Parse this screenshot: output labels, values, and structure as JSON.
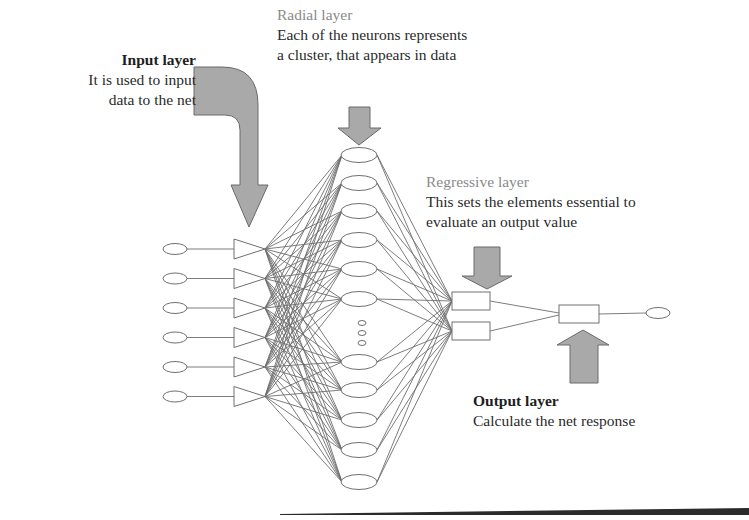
{
  "diagram": {
    "type": "neural-network-architecture",
    "layers": {
      "input": {
        "title": "Input layer",
        "description_lines": [
          "It is used to input",
          "data to the net"
        ],
        "nodes": 6,
        "node_shape": "oval-to-triangle"
      },
      "radial": {
        "title": "Radial layer",
        "description_lines": [
          "Each of the neurons represents",
          "a cluster, that appears in data"
        ],
        "nodes_shown": 11,
        "has_ellipsis": true,
        "node_shape": "ellipse"
      },
      "regressive": {
        "title": "Regressive layer",
        "description_lines": [
          "This sets the elements essential to",
          "evaluate an output value"
        ],
        "nodes": 2,
        "node_shape": "rectangle"
      },
      "output": {
        "title": "Output layer",
        "description_lines": [
          "Calculate the net response"
        ],
        "nodes": 1,
        "node_shape": "rectangle-to-oval"
      }
    },
    "colors": {
      "arrow_fill": "#a9a9a9",
      "arrow_stroke": "#6a6a6a",
      "edge": "#6e6e6e",
      "node_stroke": "#707070",
      "title_gray": "#8a8a8a",
      "text": "#2a2a2a"
    }
  }
}
